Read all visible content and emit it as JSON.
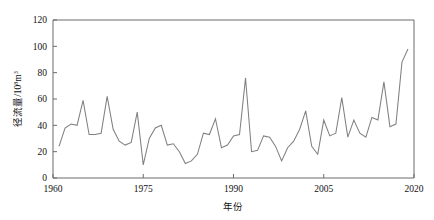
{
  "chart_data": {
    "type": "line",
    "title": "",
    "xlabel": "年份",
    "ylabel": "径流量/10⁸m³",
    "ylabel_main": "径流量/10",
    "ylabel_exponent": "8",
    "ylabel_unit": "m",
    "ylabel_unit_exponent": "3",
    "xlim": [
      1960,
      2020
    ],
    "ylim": [
      0,
      120
    ],
    "xticks": [
      1960,
      1975,
      1990,
      2005,
      2020
    ],
    "yticks": [
      0,
      20,
      40,
      60,
      80,
      100,
      120
    ],
    "grid": false,
    "legend": false,
    "legend_position": "none",
    "line_color": "#808080",
    "axis_color": "#6b6b6b",
    "series": [
      {
        "name": "径流量",
        "x": [
          1961,
          1962,
          1963,
          1964,
          1965,
          1966,
          1967,
          1968,
          1969,
          1970,
          1971,
          1972,
          1973,
          1974,
          1975,
          1976,
          1977,
          1978,
          1979,
          1980,
          1981,
          1982,
          1983,
          1984,
          1985,
          1986,
          1987,
          1988,
          1989,
          1990,
          1991,
          1992,
          1993,
          1994,
          1995,
          1996,
          1997,
          1998,
          1999,
          2000,
          2001,
          2002,
          2003,
          2004,
          2005,
          2006,
          2007,
          2008,
          2009,
          2010,
          2011,
          2012,
          2013,
          2014,
          2015,
          2016,
          2017,
          2018,
          2019
        ],
        "values": [
          24,
          38,
          41,
          40,
          59,
          33,
          33,
          34,
          62,
          37,
          28,
          25,
          27,
          50,
          10,
          30,
          38,
          40,
          25,
          26,
          20,
          11,
          13,
          18,
          34,
          33,
          45,
          23,
          25,
          32,
          33,
          76,
          20,
          21,
          32,
          31,
          24,
          13,
          23,
          28,
          37,
          51,
          24,
          18,
          44,
          32,
          34,
          61,
          31,
          44,
          34,
          31,
          46,
          44,
          73,
          39,
          41,
          88,
          98
        ]
      }
    ]
  },
  "axis": {
    "x_tick_labels": [
      "1960",
      "1975",
      "1990",
      "2005",
      "2020"
    ],
    "y_tick_labels": [
      "0",
      "20",
      "40",
      "60",
      "80",
      "100",
      "120"
    ],
    "x_title": "年份",
    "y_title_base": "径流量/10",
    "y_title_sup1": "8",
    "y_title_mid": "m",
    "y_title_sup2": "3"
  }
}
